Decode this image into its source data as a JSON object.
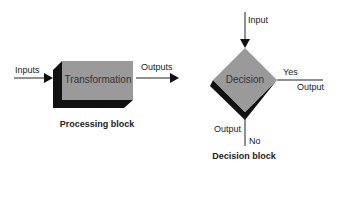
{
  "processing": {
    "input_label": "Inputs",
    "block_label": "Transformation",
    "output_label": "Outputs",
    "caption": "Processing block"
  },
  "decision": {
    "input_label": "Input",
    "block_label": "Decision",
    "yes_label": "Yes",
    "yes_output_label": "Output",
    "no_output_label": "Output",
    "no_label": "No",
    "caption": "Decision block"
  },
  "colors": {
    "block_fill": "#9a9a9a",
    "shadow": "#111111",
    "line": "#222222"
  }
}
